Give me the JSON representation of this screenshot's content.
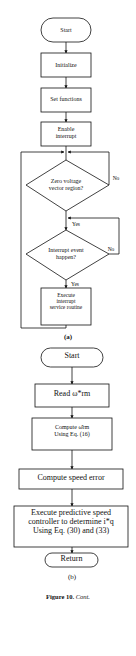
{
  "diagram_a": {
    "label": "(a)",
    "nodes": {
      "start": "Start",
      "initialize": "Initialize",
      "set_functions": "Set functions",
      "enable_interrupt": "Enable\ninterrupt",
      "zero_voltage": "Zero voltage\nvector region?",
      "interrupt_event": "Interrupt event\nhappen?",
      "execute_isr": "Execute\ninterrupt\nservice routine"
    },
    "edges": {
      "zero_no": "No",
      "zero_yes": "Yes",
      "event_no": "No",
      "event_yes": "Yes"
    }
  },
  "diagram_b": {
    "label": "(b)",
    "nodes": {
      "start": "Start",
      "read": "Read ω*rm",
      "compute_est": "Compute ω̂rm\nUsing Eq. (16)",
      "compute_error": "Compute speed error",
      "execute_controller": "Execute predictive speed\ncontroller to determine i*q\nUsing Eq. (30) and (33)",
      "return": "Return"
    }
  },
  "caption": {
    "figure": "Figure 10.",
    "cont": "Cont."
  }
}
